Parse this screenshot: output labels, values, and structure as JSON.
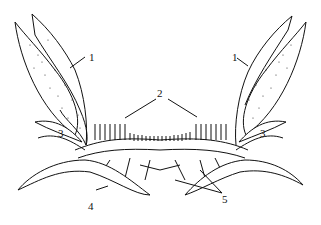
{
  "figure": {
    "type": "anatomical line drawing",
    "colors": {
      "ink": "#111111",
      "background": "#ffffff"
    },
    "labels": [
      {
        "id": "l1a",
        "text": "1",
        "x": 89,
        "y": 52
      },
      {
        "id": "l1b",
        "text": "1",
        "x": 232,
        "y": 52
      },
      {
        "id": "l2",
        "text": "2",
        "x": 160,
        "y": 93
      },
      {
        "id": "l3a",
        "text": "3",
        "x": 58,
        "y": 128
      },
      {
        "id": "l3b",
        "text": "3",
        "x": 260,
        "y": 128
      },
      {
        "id": "l4",
        "text": "4",
        "x": 88,
        "y": 203
      },
      {
        "id": "l5",
        "text": "5",
        "x": 224,
        "y": 197
      }
    ]
  }
}
